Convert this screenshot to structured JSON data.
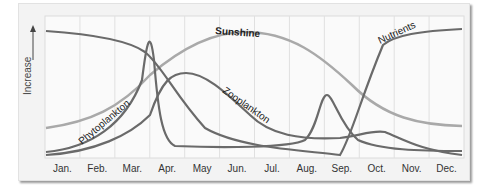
{
  "chart_data": {
    "type": "line",
    "title": "",
    "xlabel": "",
    "ylabel": "Increase",
    "categories": [
      "Jan.",
      "Feb.",
      "Mar.",
      "Apr.",
      "May",
      "Jun.",
      "Jul.",
      "Aug.",
      "Sep.",
      "Oct.",
      "Nov.",
      "Dec."
    ],
    "grid": true,
    "legend": "inline curve labels",
    "ylim": [
      0,
      100
    ],
    "series": [
      {
        "name": "Sunshine",
        "color": "#a9a9a9",
        "values": [
          18,
          30,
          50,
          72,
          88,
          94,
          90,
          75,
          52,
          35,
          24,
          20
        ]
      },
      {
        "name": "Nutrients",
        "color": "#6a6a6a",
        "values": [
          90,
          86,
          75,
          40,
          25,
          18,
          12,
          5,
          50,
          84,
          88,
          90
        ]
      },
      {
        "name": "Phytoplankton",
        "color": "#6a6a6a",
        "values": [
          4,
          8,
          25,
          98,
          8,
          6,
          6,
          10,
          45,
          12,
          6,
          5
        ]
      },
      {
        "name": "Zooplankton",
        "color": "#6a6a6a",
        "values": [
          2,
          6,
          20,
          60,
          55,
          30,
          15,
          10,
          12,
          18,
          6,
          3
        ]
      }
    ],
    "annotations": [
      "Sunshine",
      "Nutrients",
      "Phytoplankton",
      "Zooplankton"
    ]
  }
}
